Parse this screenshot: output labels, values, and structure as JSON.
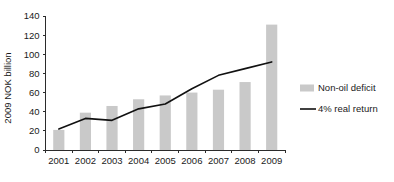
{
  "chart_data": {
    "type": "bar",
    "title": "",
    "subtitle": "",
    "xlabel": "",
    "ylabel": "2009 NOK billion",
    "categories": [
      "2001",
      "2002",
      "2003",
      "2004",
      "2005",
      "2006",
      "2007",
      "2008",
      "2009"
    ],
    "ylim": [
      0,
      140
    ],
    "yticks": [
      0,
      20,
      40,
      60,
      80,
      100,
      120,
      140
    ],
    "ytick_labels": [
      "0",
      "20",
      "40",
      "60",
      "80",
      "100",
      "120",
      "140"
    ],
    "grid": false,
    "legend_position": "right",
    "series": [
      {
        "name": "Non-oil deficit",
        "type": "bar",
        "color": "#c9c9c9",
        "values": [
          21,
          39,
          46,
          53,
          57,
          60,
          63,
          71,
          131
        ]
      },
      {
        "name": "4% real return",
        "type": "line",
        "color": "#111111",
        "values": [
          22,
          33,
          31,
          43,
          48,
          64,
          78,
          85,
          92
        ]
      }
    ]
  },
  "legend": {
    "items": [
      {
        "label": "Non-oil deficit",
        "marker": "swatch",
        "color": "#c9c9c9"
      },
      {
        "label": "4% real return",
        "marker": "line",
        "color": "#111111"
      }
    ]
  },
  "axis": {
    "y_axis_label": "2009 NOK billion"
  }
}
